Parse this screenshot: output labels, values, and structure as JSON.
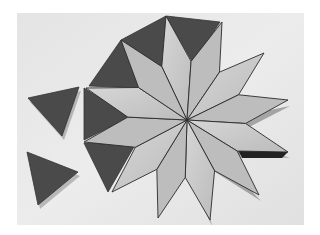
{
  "image": {
    "subject": "Pinwheel star pattern made of wooden rhombus tiles with dark triangle tiles",
    "alt": "Twelve light-colored rhombus tiles arranged as a pinwheel star, surrounded on the left and top by dark triangular tiles, with two loose dark triangles at lower left",
    "colors": {
      "border": "#ffffff",
      "background": "#e8e8e8",
      "rhombus_light": "#cfcfcf",
      "rhombus_mid": "#bdbdbd",
      "triangle_dark": "#4a4a4a",
      "seam": "#2a2a2a",
      "shadow": "#222222"
    },
    "center": [
      187,
      120
    ],
    "rhombus_tips": [
      [
        166,
        16
      ],
      [
        222,
        22
      ],
      [
        264,
        53
      ],
      [
        288,
        100
      ],
      [
        288,
        152
      ],
      [
        259,
        195
      ],
      [
        210,
        220
      ],
      [
        158,
        218
      ],
      [
        112,
        192
      ],
      [
        84,
        142
      ],
      [
        86,
        88
      ],
      [
        121,
        40
      ]
    ],
    "attached_triangles": [
      [
        [
          166,
          16
        ],
        [
          220,
          22
        ],
        [
          193,
          63
        ]
      ],
      [
        [
          121,
          40
        ],
        [
          166,
          16
        ],
        [
          163,
          68
        ]
      ],
      [
        [
          121,
          40
        ],
        [
          89,
          86
        ],
        [
          140,
          88
        ]
      ],
      [
        [
          84,
          88
        ],
        [
          130,
          117
        ],
        [
          84,
          140
        ]
      ],
      [
        [
          84,
          143
        ],
        [
          135,
          145
        ],
        [
          108,
          192
        ]
      ]
    ],
    "loose_triangles": [
      [
        [
          28,
          98
        ],
        [
          79,
          87
        ],
        [
          62,
          136
        ]
      ],
      [
        [
          27,
          152
        ],
        [
          78,
          172
        ],
        [
          38,
          205
        ]
      ]
    ]
  }
}
